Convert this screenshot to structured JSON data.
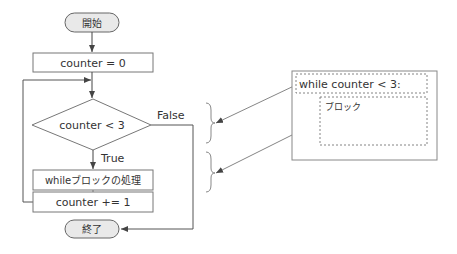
{
  "flowchart": {
    "start_label": "開始",
    "init_label": "counter = 0",
    "condition_label": "counter < 3",
    "false_label": "False",
    "true_label": "True",
    "body_label": "whileブロックの処理",
    "increment_label": "counter += 1",
    "end_label": "終了"
  },
  "code_panel": {
    "header_label": "while counter < 3:",
    "block_label": "ブロック"
  },
  "colors": {
    "stroke": "#555555",
    "terminal_fill": "#e9e9e9",
    "text": "#333333"
  }
}
